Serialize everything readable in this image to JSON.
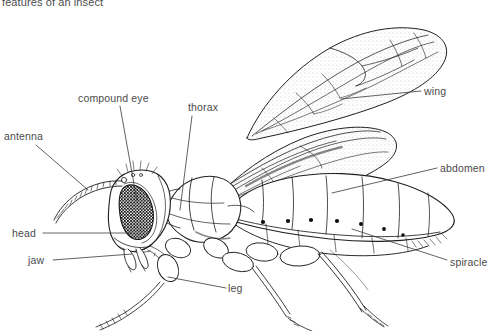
{
  "page": {
    "caption": "features of an insect",
    "background_color": "#ffffff",
    "ink_color": "#1f1f1f",
    "text_color": "#4b4b4b"
  },
  "labels": [
    {
      "id": "compound-eye",
      "text": "compound eye",
      "x": 78,
      "y": 93
    },
    {
      "id": "thorax",
      "text": "thorax",
      "x": 188,
      "y": 102
    },
    {
      "id": "wing",
      "text": "wing",
      "x": 424,
      "y": 86
    },
    {
      "id": "antenna",
      "text": "antenna",
      "x": 4,
      "y": 131
    },
    {
      "id": "abdomen",
      "text": "abdomen",
      "x": 440,
      "y": 163
    },
    {
      "id": "head",
      "text": "head",
      "x": 12,
      "y": 228
    },
    {
      "id": "jaw",
      "text": "jaw",
      "x": 28,
      "y": 255
    },
    {
      "id": "spiracle",
      "text": "spiracle",
      "x": 450,
      "y": 257
    },
    {
      "id": "leg",
      "text": "leg",
      "x": 228,
      "y": 283
    }
  ],
  "leader_lines": [
    {
      "id": "compound-eye-leader",
      "from": [
        120,
        106
      ],
      "to": [
        137,
        201
      ]
    },
    {
      "id": "thorax-leader",
      "from": [
        192,
        116
      ],
      "to": [
        180,
        210
      ]
    },
    {
      "id": "wing-leader",
      "from": [
        421,
        91
      ],
      "to": [
        341,
        99
      ]
    },
    {
      "id": "antenna-leader",
      "from": [
        36,
        145
      ],
      "to": [
        88,
        190
      ]
    },
    {
      "id": "abdomen-leader",
      "from": [
        437,
        168
      ],
      "to": [
        332,
        193
      ]
    },
    {
      "id": "head-leader",
      "from": [
        43,
        233
      ],
      "to": [
        131,
        233
      ]
    },
    {
      "id": "jaw-leader",
      "from": [
        53,
        260
      ],
      "to": [
        132,
        254
      ]
    },
    {
      "id": "spiracle-leader",
      "from": [
        447,
        260
      ],
      "to": [
        352,
        229
      ]
    },
    {
      "id": "leg-leader",
      "from": [
        226,
        288
      ],
      "to": [
        168,
        277
      ]
    }
  ],
  "anatomy": {
    "spiracle_dots": [
      [
        263,
        222
      ],
      [
        288,
        221
      ],
      [
        311,
        220
      ],
      [
        337,
        221
      ],
      [
        361,
        224
      ],
      [
        384,
        229
      ],
      [
        403,
        235
      ]
    ],
    "parts": [
      "head",
      "compound eye",
      "antenna",
      "jaw",
      "thorax",
      "wing",
      "abdomen",
      "spiracle",
      "leg"
    ]
  }
}
